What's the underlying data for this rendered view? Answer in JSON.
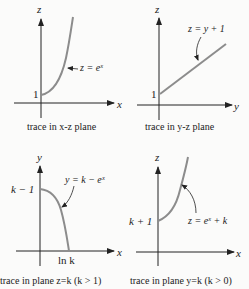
{
  "colors": {
    "axis": "#222222",
    "curve": "#8c8c8c",
    "background": "#fbfbfa"
  },
  "panels": [
    {
      "id": "xz",
      "vertical_axis": "z",
      "horizontal_axis": "x",
      "intercept_label": "1",
      "curve_label": "z = eˣ",
      "caption": "trace in x-z plane"
    },
    {
      "id": "yz",
      "vertical_axis": "z",
      "horizontal_axis": "y",
      "intercept_label": "1",
      "curve_label": "z = y + 1",
      "caption": "trace in y-z plane"
    },
    {
      "id": "zk",
      "vertical_axis": "y",
      "horizontal_axis": "x",
      "intercept_label": "k − 1",
      "x_intercept_label": "ln k",
      "curve_label": "y = k − eˣ",
      "caption": "trace in plane z=k (k > 1)"
    },
    {
      "id": "yk",
      "vertical_axis": "z",
      "horizontal_axis": "x",
      "intercept_label": "k + 1",
      "curve_label": "z = eˣ + k",
      "caption": "trace in plane y=k (k > 0)"
    }
  ]
}
